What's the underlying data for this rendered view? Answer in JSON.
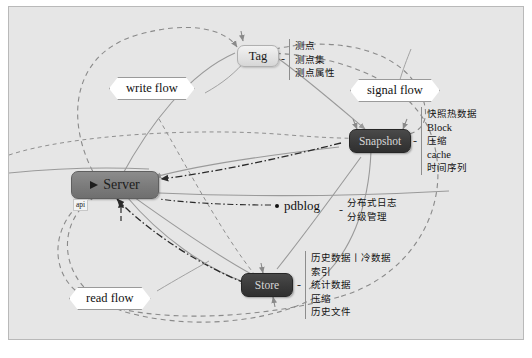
{
  "diagram": {
    "background_color": "#e6e6e6",
    "border_color": "#b9b9b9"
  },
  "nodes": [
    {
      "id": "server",
      "label": "Server",
      "style": "server",
      "badge": "api",
      "icon": "flag-icon",
      "attrs": []
    },
    {
      "id": "tag",
      "label": "Tag",
      "style": "light",
      "separator": "-",
      "attrs": [
        "测点",
        "测点集",
        "测点属性"
      ]
    },
    {
      "id": "snapshot",
      "label": "Snapshot",
      "style": "dark",
      "separator": "-",
      "attrs": [
        "快照热数据",
        "Block",
        "压缩",
        "cache",
        "时间序列"
      ]
    },
    {
      "id": "store",
      "label": "Store",
      "style": "dark",
      "separator": "-",
      "attrs": [
        "历史数据丨冷数据",
        "索引",
        "统计数据",
        "压缩",
        "历史文件"
      ]
    },
    {
      "id": "pdblog",
      "label": "pdblog",
      "style": "plain",
      "separator": "-",
      "attrs": [
        "分布式日志",
        "分级管理"
      ]
    }
  ],
  "flow_labels": [
    {
      "id": "write-flow",
      "label": "write flow"
    },
    {
      "id": "signal-flow",
      "label": "signal flow"
    },
    {
      "id": "read-flow",
      "label": "read flow"
    }
  ],
  "caption": {
    "text": ""
  },
  "colors": {
    "canvas": "#e6e6e6",
    "node_server": "#7b7b7b",
    "node_dark": "#3a3a3a",
    "node_light": "#e2e2e2",
    "edge_solid": "#9a9a9a",
    "edge_dashed": "#8a8a8a",
    "edge_dashdot": "#2a2a2a"
  }
}
